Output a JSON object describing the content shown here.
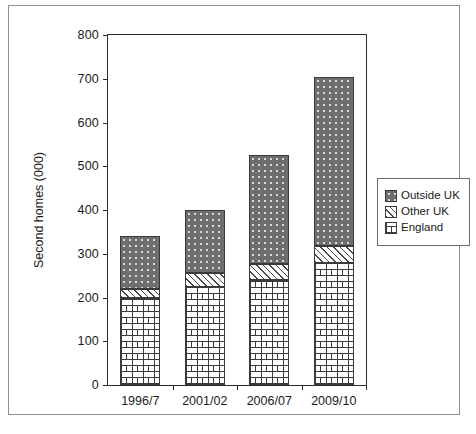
{
  "chart_data": {
    "type": "bar",
    "stacked": true,
    "title": "",
    "subtitle": "",
    "xlabel": "",
    "ylabel": "Second homes (000)",
    "categories": [
      "1996/7",
      "2001/02",
      "2006/07",
      "2009/10"
    ],
    "series": [
      {
        "name": "England",
        "values": [
          200,
          225,
          240,
          280
        ]
      },
      {
        "name": "Other UK",
        "values": [
          20,
          30,
          37,
          37
        ]
      },
      {
        "name": "Outside UK",
        "values": [
          120,
          145,
          248,
          388
        ]
      }
    ],
    "totals": [
      340,
      400,
      525,
      705
    ],
    "ylim": [
      0,
      800
    ],
    "yticks": [
      0,
      100,
      200,
      300,
      400,
      500,
      600,
      700,
      800
    ],
    "ytick_labels": [
      "0",
      "100",
      "200",
      "300",
      "400",
      "500",
      "600",
      "700",
      "800"
    ],
    "grid": false,
    "legend_position": "right",
    "legend_entries": [
      {
        "label": "Outside UK",
        "pattern": "dark-dotted",
        "color": "#6e6e6e"
      },
      {
        "label": "Other UK",
        "pattern": "diagonal-hatch",
        "color": "#f4f4f4"
      },
      {
        "label": "England",
        "pattern": "brick",
        "color": "#ffffff"
      }
    ],
    "axis_color": "#2b2b2b",
    "background": "#ffffff"
  }
}
